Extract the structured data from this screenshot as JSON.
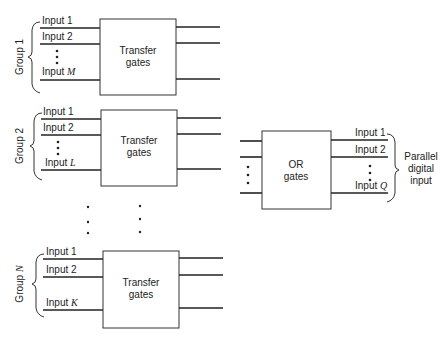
{
  "diagram": {
    "type": "block-diagram",
    "groups": [
      {
        "label": "Group 1",
        "label_prefix": "Group",
        "label_index": "1",
        "block_label_line1": "Transfer",
        "block_label_line2": "gates",
        "inputs": [
          {
            "prefix": "Input",
            "index": "1"
          },
          {
            "prefix": "Input",
            "index": "2"
          },
          {
            "prefix": "Input",
            "index": "M"
          }
        ]
      },
      {
        "label": "Group 2",
        "label_prefix": "Group",
        "label_index": "2",
        "block_label_line1": "Transfer",
        "block_label_line2": "gates",
        "inputs": [
          {
            "prefix": "Input",
            "index": "1"
          },
          {
            "prefix": "Input",
            "index": "2"
          },
          {
            "prefix": "Input",
            "index": "L"
          }
        ]
      },
      {
        "label": "Group N",
        "label_prefix": "Group",
        "label_index": "N",
        "block_label_line1": "Transfer",
        "block_label_line2": "gates",
        "inputs": [
          {
            "prefix": "Input",
            "index": "1"
          },
          {
            "prefix": "Input",
            "index": "2"
          },
          {
            "prefix": "Input",
            "index": "K"
          }
        ]
      }
    ],
    "or_block": {
      "label_line1": "OR",
      "label_line2": "gates",
      "outputs": [
        {
          "prefix": "Input",
          "index": "1"
        },
        {
          "prefix": "Input",
          "index": "2"
        },
        {
          "prefix": "Input",
          "index": "Q"
        }
      ]
    },
    "output_label": [
      "Parallel",
      "digital",
      "input"
    ]
  }
}
